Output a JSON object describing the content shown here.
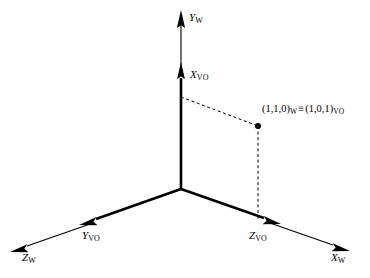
{
  "figure": {
    "background_color": "#ffffff",
    "stroke_color": "#000000"
  },
  "axes": [
    {
      "id": "y-world",
      "name": "Y_W",
      "letter": "Y",
      "subscript": "W",
      "frame": "W",
      "direction": "up"
    },
    {
      "id": "x-vo",
      "name": "X_VO",
      "letter": "X",
      "subscript": "VO",
      "frame": "VO",
      "direction": "up"
    },
    {
      "id": "z-world",
      "name": "Z_W",
      "letter": "Z",
      "subscript": "W",
      "frame": "W",
      "direction": "down-left"
    },
    {
      "id": "y-vo",
      "name": "Y_VO",
      "letter": "Y",
      "subscript": "VO",
      "frame": "VO",
      "direction": "down-left"
    },
    {
      "id": "x-world",
      "name": "X_W",
      "letter": "X",
      "subscript": "W",
      "frame": "W",
      "direction": "down-right"
    },
    {
      "id": "z-vo",
      "name": "Z_VO",
      "letter": "Z",
      "subscript": "VO",
      "frame": "VO",
      "direction": "down-right"
    }
  ],
  "point": {
    "name": "equivalence-point",
    "world_coords": "(1,1,0)",
    "world_subscript": "W",
    "equiv_symbol": "≡",
    "vo_coords": "(1,0,1)",
    "vo_subscript": "VO",
    "full_text": "(1,1,0)W ≡ (1,0,1)VO"
  },
  "projection_lines": [
    {
      "name": "dashed-line-to-vertical-axis",
      "style": "dashed",
      "from": "point",
      "to": "y-axis"
    },
    {
      "name": "dashed-line-to-ground-axis",
      "style": "dashed",
      "from": "point",
      "to": "x-world-axis"
    }
  ]
}
